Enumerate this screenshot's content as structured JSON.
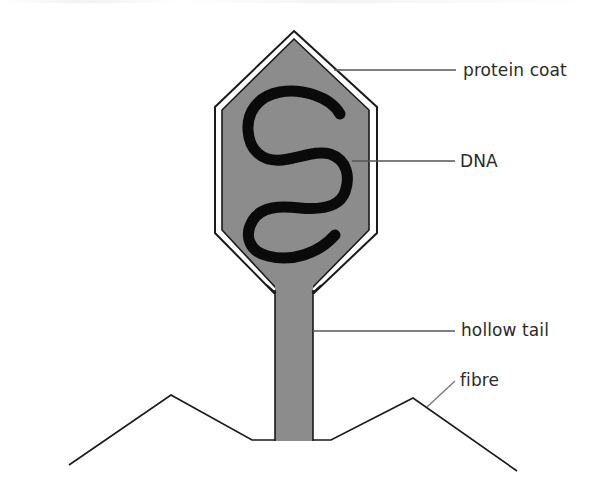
{
  "diagram": {
    "colors": {
      "head_fill": "#8c8c8c",
      "outline": "#1a1a1a",
      "inner_gap": "#ffffff",
      "dna": "#0a0a0a",
      "leader_line": "#555555",
      "label_text": "#2a2a2a"
    },
    "parts": [
      {
        "id": "head",
        "name": "protein coat"
      },
      {
        "id": "dna",
        "name": "DNA"
      },
      {
        "id": "tail",
        "name": "hollow tail"
      },
      {
        "id": "fibres",
        "name": "fibre"
      }
    ],
    "labels": {
      "protein_coat": "protein coat",
      "dna": "DNA",
      "hollow_tail": "hollow tail",
      "fibre": "fibre"
    }
  }
}
